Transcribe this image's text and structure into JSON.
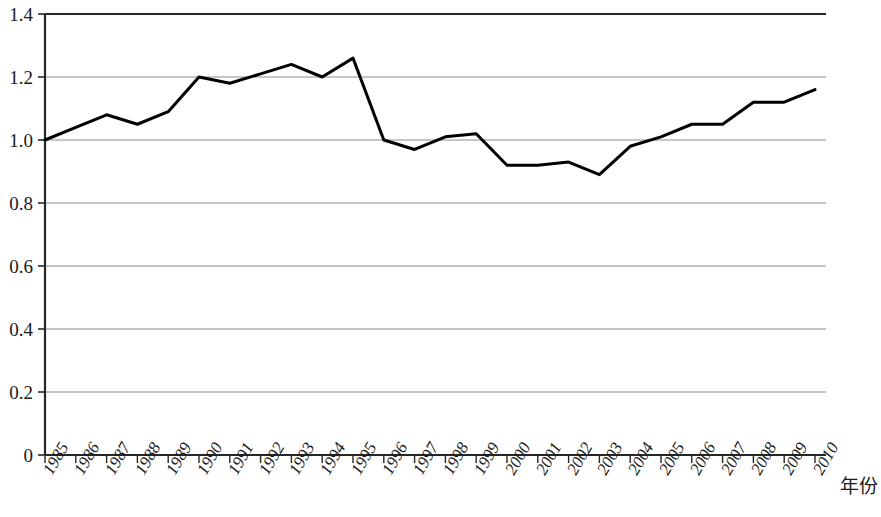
{
  "chart_data": {
    "type": "line",
    "title": "",
    "subtitle": "",
    "xlabel": "年份",
    "ylabel": "",
    "grid": true,
    "legend": false,
    "legend_position": "none",
    "xlim": [
      1985,
      2010
    ],
    "ylim": [
      0,
      1.4
    ],
    "ytick_labels": [
      "1.4",
      "1.2",
      "1.0",
      "0.8",
      "0.6",
      "0.4",
      "0.2",
      "0"
    ],
    "ytick_values": [
      1.4,
      1.2,
      1.0,
      0.8,
      0.6,
      0.4,
      0.2,
      0
    ],
    "categories": [
      "1985",
      "1986",
      "1987",
      "1988",
      "1989",
      "1990",
      "1991",
      "1992",
      "1993",
      "1994",
      "1995",
      "1996",
      "1997",
      "1998",
      "1999",
      "2000",
      "2001",
      "2002",
      "2003",
      "2004",
      "2005",
      "2006",
      "2007",
      "2008",
      "2009",
      "2010"
    ],
    "values": [
      1.0,
      1.04,
      1.08,
      1.05,
      1.09,
      1.2,
      1.18,
      1.21,
      1.24,
      1.2,
      1.26,
      1.0,
      0.97,
      1.01,
      1.02,
      0.92,
      0.92,
      0.93,
      0.89,
      0.98,
      1.01,
      1.05,
      1.05,
      1.12,
      1.12,
      1.16
    ],
    "series": [
      {
        "name": "",
        "values": [
          1.0,
          1.04,
          1.08,
          1.05,
          1.09,
          1.2,
          1.18,
          1.21,
          1.24,
          1.2,
          1.26,
          1.0,
          0.97,
          1.01,
          1.02,
          0.92,
          0.92,
          0.93,
          0.89,
          0.98,
          1.01,
          1.05,
          1.05,
          1.12,
          1.12,
          1.16
        ],
        "color": "#000000",
        "line_width": 3
      }
    ],
    "colors": {
      "line": "#000000",
      "axis": "#262626",
      "grid": "#8c8c8c",
      "text": "#1a1a1a",
      "background": "#ffffff"
    }
  }
}
